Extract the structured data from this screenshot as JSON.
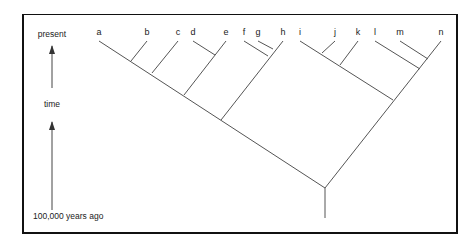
{
  "axis": {
    "top_label": "present",
    "middle_label": "time",
    "bottom_label": "100,000 years ago"
  },
  "tree": {
    "tips": [
      {
        "id": "a",
        "x": 99,
        "y": 41
      },
      {
        "id": "b",
        "x": 147,
        "y": 41
      },
      {
        "id": "c",
        "x": 178,
        "y": 41
      },
      {
        "id": "d",
        "x": 193,
        "y": 41
      },
      {
        "id": "e",
        "x": 226,
        "y": 41
      },
      {
        "id": "f",
        "x": 244,
        "y": 41
      },
      {
        "id": "g",
        "x": 258,
        "y": 41
      },
      {
        "id": "h",
        "x": 283,
        "y": 41
      },
      {
        "id": "i",
        "x": 300,
        "y": 41
      },
      {
        "id": "j",
        "x": 335,
        "y": 41
      },
      {
        "id": "k",
        "x": 358,
        "y": 41
      },
      {
        "id": "l",
        "x": 375,
        "y": 41
      },
      {
        "id": "m",
        "x": 400,
        "y": 41
      },
      {
        "id": "n",
        "x": 441,
        "y": 41
      }
    ],
    "branches": [
      {
        "from": [
          325,
          188
        ],
        "to": [
          99,
          41
        ]
      },
      {
        "from": [
          325,
          188
        ],
        "to": [
          441,
          41
        ]
      },
      {
        "from": [
          131,
          61
        ],
        "to": [
          147,
          41
        ]
      },
      {
        "from": [
          152,
          73
        ],
        "to": [
          178,
          41
        ]
      },
      {
        "from": [
          184,
          95
        ],
        "to": [
          226,
          41
        ]
      },
      {
        "from": [
          215,
          55
        ],
        "to": [
          193,
          41
        ]
      },
      {
        "from": [
          221,
          120
        ],
        "to": [
          283,
          41
        ]
      },
      {
        "from": [
          268,
          56
        ],
        "to": [
          244,
          41
        ]
      },
      {
        "from": [
          273,
          49
        ],
        "to": [
          258,
          41
        ]
      },
      {
        "from": [
          393,
          100
        ],
        "to": [
          300,
          41
        ]
      },
      {
        "from": [
          322,
          53
        ],
        "to": [
          335,
          41
        ]
      },
      {
        "from": [
          340,
          65
        ],
        "to": [
          358,
          41
        ]
      },
      {
        "from": [
          420,
          69
        ],
        "to": [
          375,
          41
        ]
      },
      {
        "from": [
          428,
          59
        ],
        "to": [
          400,
          41
        ]
      },
      {
        "from": [
          325,
          188
        ],
        "to": [
          325,
          218
        ]
      }
    ]
  }
}
